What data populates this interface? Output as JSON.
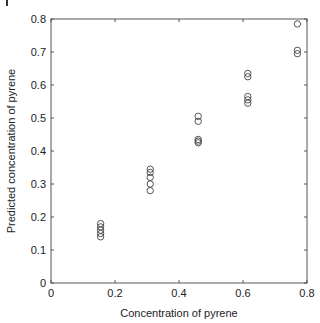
{
  "chart_data": {
    "type": "scatter",
    "title": "",
    "xlabel": "Concentration of pyrene",
    "ylabel": "Predicted concentration of pyrene",
    "xlim": [
      0,
      0.8
    ],
    "ylim": [
      0,
      0.8
    ],
    "xticks": [
      "0",
      "0.2",
      "0.4",
      "0.6",
      "0.8"
    ],
    "yticks": [
      "0",
      "0.1",
      "0.2",
      "0.3",
      "0.4",
      "0.5",
      "0.6",
      "0.7",
      "0.8"
    ],
    "grid": false,
    "marker": "open-circle",
    "series": [
      {
        "name": "Predicted vs actual",
        "points": [
          {
            "x": 0.155,
            "y": 0.18
          },
          {
            "x": 0.155,
            "y": 0.17
          },
          {
            "x": 0.155,
            "y": 0.16
          },
          {
            "x": 0.155,
            "y": 0.15
          },
          {
            "x": 0.155,
            "y": 0.14
          },
          {
            "x": 0.31,
            "y": 0.345
          },
          {
            "x": 0.31,
            "y": 0.335
          },
          {
            "x": 0.31,
            "y": 0.32
          },
          {
            "x": 0.31,
            "y": 0.3
          },
          {
            "x": 0.31,
            "y": 0.28
          },
          {
            "x": 0.46,
            "y": 0.505
          },
          {
            "x": 0.46,
            "y": 0.49
          },
          {
            "x": 0.46,
            "y": 0.435
          },
          {
            "x": 0.46,
            "y": 0.43
          },
          {
            "x": 0.46,
            "y": 0.425
          },
          {
            "x": 0.615,
            "y": 0.635
          },
          {
            "x": 0.615,
            "y": 0.625
          },
          {
            "x": 0.615,
            "y": 0.565
          },
          {
            "x": 0.615,
            "y": 0.555
          },
          {
            "x": 0.615,
            "y": 0.545
          },
          {
            "x": 0.77,
            "y": 0.785
          },
          {
            "x": 0.77,
            "y": 0.705
          },
          {
            "x": 0.77,
            "y": 0.695
          }
        ]
      }
    ]
  },
  "colors": {
    "axis": "#555555",
    "marker": "#444444",
    "text": "#222222"
  }
}
